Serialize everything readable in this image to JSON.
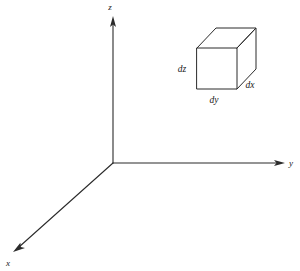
{
  "figure": {
    "background_color": "#ffffff",
    "line_color": "#2b2b2b",
    "text_color": "#1a1a1a"
  },
  "axes": {
    "origin": {
      "x": 113,
      "y": 163
    },
    "items": [
      {
        "name": "z",
        "label": "z",
        "label_x": 110,
        "label_y": 10,
        "line": {
          "x1": 113,
          "y1": 163,
          "x2": 113,
          "y2": 22
        },
        "arrow_points": "113,16 110,27 113,24.5 116,27"
      },
      {
        "name": "y",
        "label": "y",
        "label_x": 289,
        "label_y": 166,
        "line": {
          "x1": 113,
          "y1": 163,
          "x2": 278,
          "y2": 163
        },
        "arrow_points": "285,163 274,160 276.5,163 274,166"
      },
      {
        "name": "x",
        "label": "x",
        "label_x": 6,
        "label_y": 266,
        "line": {
          "x1": 113,
          "y1": 163,
          "x2": 19,
          "y2": 247
        },
        "arrow_points": "13,252 24,248.5 20.5,247.2 20.2,243.6"
      }
    ]
  },
  "cube": {
    "name": "differential-volume-element",
    "front_face": {
      "left": 197,
      "right": 237,
      "top": 48,
      "bottom": 89
    },
    "depth_offset": {
      "dx": 19,
      "dy": -20
    },
    "vertices": {
      "front_top_left": {
        "x": 197,
        "y": 48
      },
      "front_top_right": {
        "x": 237,
        "y": 48
      },
      "front_bottom_left": {
        "x": 197,
        "y": 89
      },
      "front_bottom_right": {
        "x": 237,
        "y": 89
      },
      "back_top_left": {
        "x": 216,
        "y": 28
      },
      "back_top_right": {
        "x": 256,
        "y": 28
      },
      "back_bottom_right": {
        "x": 256,
        "y": 69
      }
    },
    "labels": [
      {
        "name": "dz",
        "text": "dz",
        "x": 182,
        "y": 72
      },
      {
        "name": "dy",
        "text": "dy",
        "x": 207,
        "y": 103
      },
      {
        "name": "dx",
        "text": "dx",
        "x": 243,
        "y": 87
      }
    ]
  }
}
